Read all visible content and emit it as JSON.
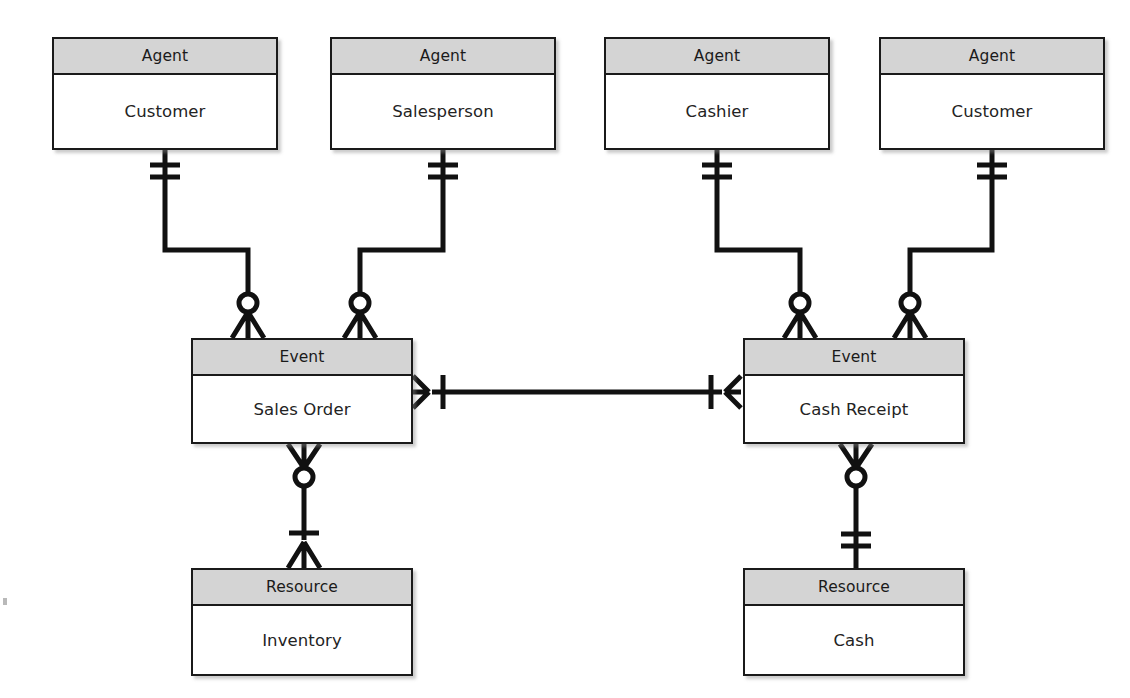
{
  "diagram": {
    "type": "entity-relationship",
    "notation": "crow's-foot",
    "colors": {
      "header_fill": "#d4d4d4",
      "body_fill": "#ffffff",
      "stroke": "#1a1a1a",
      "background": "#ffffff"
    }
  },
  "entities": [
    {
      "id": "agent-customer-sales",
      "category": "Agent",
      "name": "Customer",
      "x": 52,
      "y": 37,
      "w": 226,
      "h": 113
    },
    {
      "id": "agent-salesperson",
      "category": "Agent",
      "name": "Salesperson",
      "x": 330,
      "y": 37,
      "w": 226,
      "h": 113
    },
    {
      "id": "agent-cashier",
      "category": "Agent",
      "name": "Cashier",
      "x": 604,
      "y": 37,
      "w": 226,
      "h": 113
    },
    {
      "id": "agent-customer-cash",
      "category": "Agent",
      "name": "Customer",
      "x": 879,
      "y": 37,
      "w": 226,
      "h": 113
    },
    {
      "id": "event-sales-order",
      "category": "Event",
      "name": "Sales Order",
      "x": 191,
      "y": 338,
      "w": 222,
      "h": 106
    },
    {
      "id": "event-cash-receipt",
      "category": "Event",
      "name": "Cash Receipt",
      "x": 743,
      "y": 338,
      "w": 222,
      "h": 106
    },
    {
      "id": "resource-inventory",
      "category": "Resource",
      "name": "Inventory",
      "x": 191,
      "y": 568,
      "w": 222,
      "h": 108
    },
    {
      "id": "resource-cash",
      "category": "Resource",
      "name": "Cash",
      "x": 743,
      "y": 568,
      "w": 222,
      "h": 108
    }
  ],
  "relationships": [
    {
      "id": "rel-customer-sales-order",
      "from": "agent-customer-sales",
      "to": "event-sales-order",
      "from_cardinality": "exactly-one",
      "to_cardinality": "zero-or-many",
      "label": ""
    },
    {
      "id": "rel-salesperson-sales-order",
      "from": "agent-salesperson",
      "to": "event-sales-order",
      "from_cardinality": "exactly-one",
      "to_cardinality": "zero-or-many",
      "label": ""
    },
    {
      "id": "rel-cashier-cash-receipt",
      "from": "agent-cashier",
      "to": "event-cash-receipt",
      "from_cardinality": "exactly-one",
      "to_cardinality": "zero-or-many",
      "label": ""
    },
    {
      "id": "rel-customer-cash-receipt",
      "from": "agent-customer-cash",
      "to": "event-cash-receipt",
      "from_cardinality": "exactly-one",
      "to_cardinality": "zero-or-many",
      "label": ""
    },
    {
      "id": "rel-sales-order-cash-receipt",
      "from": "event-sales-order",
      "to": "event-cash-receipt",
      "from_cardinality": "one-or-many",
      "to_cardinality": "one-or-many",
      "label": ""
    },
    {
      "id": "rel-sales-order-inventory",
      "from": "event-sales-order",
      "to": "resource-inventory",
      "from_cardinality": "zero-or-many",
      "to_cardinality": "one-or-many",
      "label": ""
    },
    {
      "id": "rel-cash-receipt-cash",
      "from": "event-cash-receipt",
      "to": "resource-cash",
      "from_cardinality": "zero-or-many",
      "to_cardinality": "exactly-one",
      "label": ""
    }
  ]
}
